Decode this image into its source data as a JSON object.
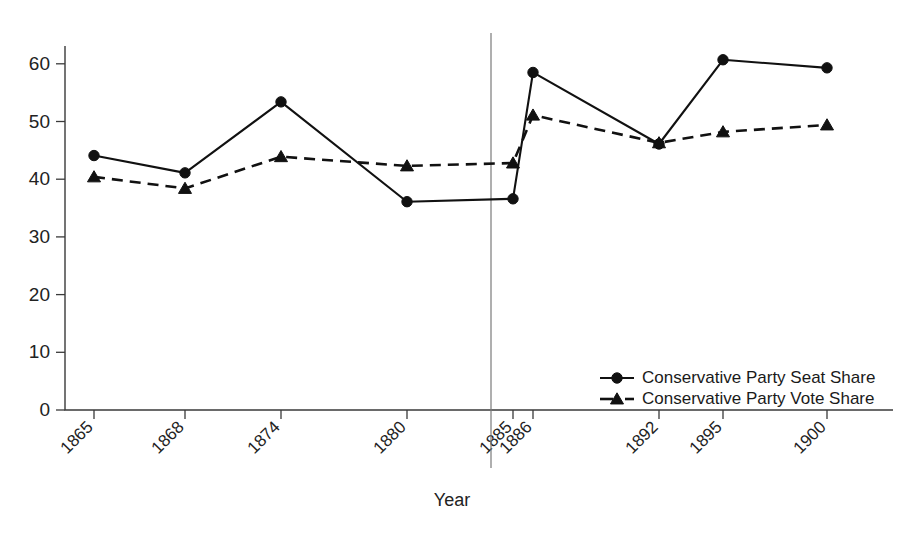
{
  "chart_data": {
    "type": "line",
    "title": "",
    "xlabel": "Year",
    "ylabel": "",
    "categories": [
      "1865",
      "1868",
      "1874",
      "1880",
      "1885",
      "1886",
      "1892",
      "1895",
      "1900"
    ],
    "ylim": [
      0,
      65
    ],
    "yticks": [
      0,
      10,
      20,
      30,
      40,
      50,
      60
    ],
    "ytick_labels": [
      "0",
      "10",
      "20",
      "30",
      "40",
      "50",
      "60"
    ],
    "grid": false,
    "legend_position": "bottom-right",
    "annotations": [
      {
        "name": "reform-act-vertical-line",
        "x": "between 1880 and 1885",
        "label": ""
      }
    ],
    "series": [
      {
        "name": "Conservative Party Seat Share",
        "marker": "circle",
        "linestyle": "solid",
        "color": "#111111",
        "values": [
          44.1,
          41.1,
          53.4,
          36.1,
          36.6,
          58.5,
          46.1,
          60.7,
          59.3
        ]
      },
      {
        "name": "Conservative Party Vote Share",
        "marker": "triangle",
        "linestyle": "dashed",
        "color": "#111111",
        "values": [
          40.4,
          38.4,
          43.9,
          42.3,
          42.8,
          51.1,
          46.3,
          48.2,
          49.4
        ]
      }
    ]
  },
  "legend": {
    "items": [
      {
        "label": "Conservative Party Seat Share",
        "marker": "circle",
        "linestyle": "solid"
      },
      {
        "label": "Conservative Party Vote Share",
        "marker": "triangle",
        "linestyle": "dashed"
      }
    ]
  },
  "axes": {
    "x_title": "Year"
  }
}
